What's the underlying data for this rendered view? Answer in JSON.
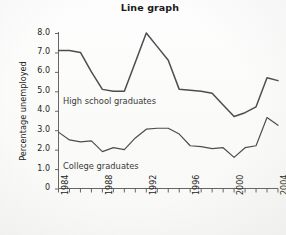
{
  "chart_data": {
    "type": "line",
    "title": "Line graph",
    "xlabel": "",
    "ylabel": "Percentage unemployed",
    "ylim": [
      0,
      8.4
    ],
    "yticks": [
      0,
      1.0,
      2.0,
      3.0,
      4.0,
      5.0,
      6.0,
      7.0,
      8.0
    ],
    "ytick_labels": [
      "0",
      "1.0",
      "2.0",
      "3.0",
      "4.0",
      "5.0",
      "6.0",
      "7.0",
      "8.0"
    ],
    "xlim": [
      1984,
      2004
    ],
    "x": [
      1984,
      1985,
      1986,
      1987,
      1988,
      1989,
      1990,
      1991,
      1992,
      1993,
      1994,
      1995,
      1996,
      1997,
      1998,
      1999,
      2000,
      2001,
      2002,
      2003,
      2004
    ],
    "xticks": [
      1984,
      1985,
      1986,
      1987,
      1988,
      1989,
      1990,
      1991,
      1992,
      1993,
      1994,
      1995,
      1996,
      1997,
      1998,
      1999,
      2000,
      2001,
      2002,
      2003,
      2004
    ],
    "xtick_labels": [
      "1984",
      "1988",
      "1992",
      "1996",
      "2000",
      "2004"
    ],
    "xtick_labelled_years": [
      1984,
      1988,
      1992,
      1996,
      2000,
      2004
    ],
    "grid": false,
    "legend": "inline-annotations",
    "series": [
      {
        "name": "High school graduates",
        "color": "#4d4d4d",
        "label_x": 1985,
        "label_y": 4.55,
        "values": [
          7.1,
          7.1,
          7.0,
          6.0,
          5.1,
          5.0,
          5.0,
          6.5,
          8.0,
          7.3,
          6.6,
          5.1,
          5.05,
          5.0,
          4.9,
          4.3,
          3.7,
          3.9,
          4.2,
          5.7,
          5.55
        ]
      },
      {
        "name": "College graduates",
        "color": "#4d4d4d",
        "label_x": 1985,
        "label_y": 1.4,
        "values": [
          2.9,
          2.5,
          2.4,
          2.45,
          1.9,
          2.1,
          2.0,
          2.6,
          3.05,
          3.1,
          3.1,
          2.8,
          2.2,
          2.15,
          2.05,
          2.1,
          1.6,
          2.1,
          2.2,
          3.65,
          3.25
        ]
      }
    ],
    "annotations": [
      {
        "text": "High school graduates"
      },
      {
        "text": "College graduates"
      }
    ]
  },
  "axis": {
    "y_title": "Percentage unemployed"
  }
}
